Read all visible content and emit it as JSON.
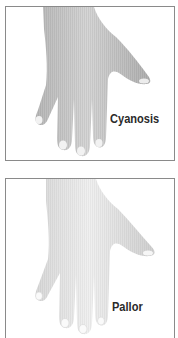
{
  "panels": [
    {
      "id": "cyanosis",
      "label": "Cyanosis",
      "illustration": "hand-dorsal-view-icon",
      "skin_tone": "#c9c9c9",
      "shade_tone": "#a9a9a9"
    },
    {
      "id": "pallor",
      "label": "Pallor",
      "illustration": "hand-dorsal-view-icon",
      "skin_tone": "#e6e6e6",
      "shade_tone": "#c4c4c4"
    }
  ],
  "colors": {
    "border": "#8a8a8a",
    "label_text": "#2a2a2a",
    "background": "#ffffff"
  }
}
